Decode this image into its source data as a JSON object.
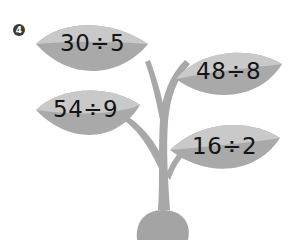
{
  "problem": {
    "number": "4",
    "badge_glyph": "❹"
  },
  "plant": {
    "leaves": [
      {
        "position": "top-left",
        "expression": "30÷5",
        "dividend": 30,
        "divisor": 5
      },
      {
        "position": "top-right",
        "expression": "48÷8",
        "dividend": 48,
        "divisor": 8
      },
      {
        "position": "bottom-left",
        "expression": "54÷9",
        "dividend": 54,
        "divisor": 9
      },
      {
        "position": "bottom-right",
        "expression": "16÷2",
        "dividend": 16,
        "divisor": 2
      }
    ]
  },
  "colors": {
    "leaf_light": "#c9c9c9",
    "leaf_dark": "#a9a9a9",
    "stem": "#a8a8a8",
    "pot": "#a4a4a4",
    "text": "#151515",
    "badge": "#3a3a3a"
  }
}
